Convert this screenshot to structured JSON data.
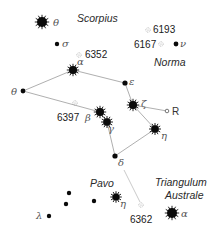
{
  "constellations": [
    {
      "name": "Scorpius",
      "x": 77,
      "y": 22
    },
    {
      "name": "Norma",
      "x": 154,
      "y": 66
    },
    {
      "name": "Pavo",
      "x": 90,
      "y": 187
    },
    {
      "name": "Triangulum",
      "x": 155,
      "y": 186
    },
    {
      "name": "Australe",
      "x": 165,
      "y": 199
    }
  ],
  "stars": [
    {
      "id": "theta-sco",
      "label": "θ",
      "x": 42,
      "y": 22,
      "r": 5,
      "spiky": true,
      "lx": 53,
      "ly": 26
    },
    {
      "id": "sigma-sco",
      "label": "σ",
      "x": 57,
      "y": 44,
      "r": 2.2,
      "spiky": false,
      "lx": 62,
      "ly": 47
    },
    {
      "id": "alpha-ara",
      "label": "α",
      "x": 73,
      "y": 70,
      "r": 4,
      "spiky": true,
      "lx": 77,
      "ly": 65
    },
    {
      "id": "epsilon-ara",
      "label": "ε",
      "x": 125,
      "y": 83,
      "r": 2.6,
      "spiky": false,
      "lx": 129,
      "ly": 85
    },
    {
      "id": "theta-ara",
      "label": "θ",
      "x": 23,
      "y": 91,
      "r": 2.4,
      "spiky": false,
      "lx": 11,
      "ly": 95
    },
    {
      "id": "beta-ara",
      "label": "β",
      "x": 100,
      "y": 112,
      "r": 4,
      "spiky": true,
      "lx": 85,
      "ly": 121
    },
    {
      "id": "gamma-ara",
      "label": "γ",
      "x": 107,
      "y": 122,
      "r": 3.8,
      "spiky": true,
      "lx": 108,
      "ly": 132
    },
    {
      "id": "zeta-ara",
      "label": "ζ",
      "x": 133,
      "y": 105,
      "r": 4,
      "spiky": true,
      "lx": 141,
      "ly": 107
    },
    {
      "id": "eta-ara",
      "label": "η",
      "x": 155,
      "y": 129,
      "r": 3.8,
      "spiky": true,
      "lx": 161,
      "ly": 139
    },
    {
      "id": "delta-ara",
      "label": "δ",
      "x": 115,
      "y": 156,
      "r": 2.6,
      "spiky": false,
      "lx": 118,
      "ly": 166
    },
    {
      "id": "nu-nor",
      "label": "ν",
      "x": 176,
      "y": 44,
      "r": 2.4,
      "spiky": false,
      "lx": 180,
      "ly": 47
    },
    {
      "id": "pavo-1",
      "label": "",
      "x": 69,
      "y": 193,
      "r": 2.2,
      "spiky": false,
      "lx": 0,
      "ly": 0
    },
    {
      "id": "pavo-2",
      "label": "",
      "x": 66,
      "y": 204,
      "r": 2.2,
      "spiky": false,
      "lx": 0,
      "ly": 0
    },
    {
      "id": "pavo-3",
      "label": "",
      "x": 94,
      "y": 201,
      "r": 2.2,
      "spiky": false,
      "lx": 0,
      "ly": 0
    },
    {
      "id": "eta-pav",
      "label": "η",
      "x": 116,
      "y": 197,
      "r": 3.6,
      "spiky": true,
      "lx": 120,
      "ly": 207
    },
    {
      "id": "lambda-pav",
      "label": "λ",
      "x": 49,
      "y": 216,
      "r": 2.2,
      "spiky": false,
      "lx": 36,
      "ly": 219
    },
    {
      "id": "alpha-tra",
      "label": "α",
      "x": 172,
      "y": 213,
      "r": 5,
      "spiky": true,
      "lx": 181,
      "ly": 217
    }
  ],
  "deep_sky": [
    {
      "id": "ngc6193",
      "label": "6193",
      "x": 148,
      "y": 30,
      "lx": 153,
      "ly": 33
    },
    {
      "id": "ngc6167",
      "label": "6167",
      "x": 161,
      "y": 44,
      "lx": 134,
      "ly": 48
    },
    {
      "id": "ngc6352",
      "label": "6352",
      "x": 79,
      "y": 55,
      "lx": 85,
      "ly": 58
    },
    {
      "id": "ngc6397",
      "label": "6397",
      "x": 75,
      "y": 103,
      "lx": 57,
      "ly": 121
    },
    {
      "id": "ngc6362",
      "label": "6362",
      "x": 141,
      "y": 205,
      "lx": 130,
      "ly": 223
    }
  ],
  "variable_stars": [
    {
      "id": "r-ara",
      "label": "R",
      "x": 167,
      "y": 111,
      "lx": 172,
      "ly": 115
    }
  ],
  "lines": [
    {
      "from": [
        23,
        91
      ],
      "to": [
        73,
        70
      ]
    },
    {
      "from": [
        73,
        70
      ],
      "to": [
        125,
        83
      ]
    },
    {
      "from": [
        125,
        83
      ],
      "to": [
        133,
        105
      ]
    },
    {
      "from": [
        133,
        105
      ],
      "to": [
        155,
        129
      ]
    },
    {
      "from": [
        155,
        129
      ],
      "to": [
        115,
        156
      ]
    },
    {
      "from": [
        115,
        156
      ],
      "to": [
        107,
        122
      ]
    },
    {
      "from": [
        107,
        122
      ],
      "to": [
        100,
        112
      ]
    },
    {
      "from": [
        100,
        112
      ],
      "to": [
        23,
        91
      ]
    },
    {
      "from": [
        133,
        105
      ],
      "to": [
        167,
        111
      ]
    }
  ],
  "faint_lines": [
    {
      "from": [
        124,
        170
      ],
      "to": [
        140,
        202
      ]
    }
  ],
  "colors": {
    "star": "#0a0a0a",
    "line": "#9a9a9a",
    "label": "#555555",
    "background": "#ffffff"
  }
}
